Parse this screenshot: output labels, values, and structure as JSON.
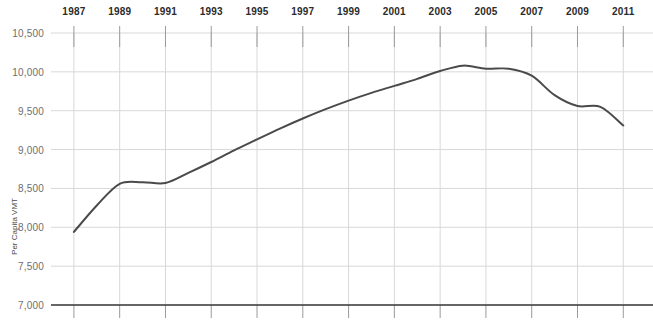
{
  "chart_data": {
    "type": "line",
    "title": "",
    "xlabel": "",
    "ylabel": "Per Capita VMT",
    "xlim": [
      1986,
      2011.6
    ],
    "ylim": [
      7000,
      10500
    ],
    "grid": true,
    "legend": false,
    "x_tick_labels": [
      "1987",
      "1989",
      "1991",
      "1993",
      "1995",
      "1997",
      "1999",
      "2001",
      "2003",
      "2005",
      "2007",
      "2009",
      "2011"
    ],
    "x_ticks": [
      1987,
      1989,
      1991,
      1993,
      1995,
      1997,
      1999,
      2001,
      2003,
      2005,
      2007,
      2009,
      2011
    ],
    "y_tick_labels": [
      "10,500",
      "10,000",
      "9,500",
      "9,000",
      "8,500",
      "8,000",
      "7,500",
      "7,000"
    ],
    "y_ticks": [
      10500,
      10000,
      9500,
      9000,
      8500,
      8000,
      7500,
      7000
    ],
    "line_color": "#4a4a4a",
    "grid_color": "#d8d8d8",
    "axis_color": "#3a3a3a",
    "x": [
      1987,
      1988,
      1989,
      1990,
      1991,
      1992,
      1993,
      1994,
      1995,
      1996,
      1997,
      1998,
      1999,
      2000,
      2001,
      2002,
      2003,
      2004,
      2005,
      2006,
      2007,
      2008,
      2009,
      2010,
      2011
    ],
    "values": [
      7940,
      8280,
      8560,
      8580,
      8570,
      8700,
      8840,
      8990,
      9130,
      9270,
      9400,
      9520,
      9630,
      9730,
      9820,
      9910,
      10010,
      10080,
      10040,
      10040,
      9950,
      9700,
      9560,
      9550,
      9310
    ],
    "series": [
      {
        "name": "Per Capita VMT",
        "values": [
          7940,
          8280,
          8560,
          8580,
          8570,
          8700,
          8840,
          8990,
          9130,
          9270,
          9400,
          9520,
          9630,
          9730,
          9820,
          9910,
          10010,
          10080,
          10040,
          10040,
          9950,
          9700,
          9560,
          9550,
          9310
        ]
      }
    ]
  }
}
